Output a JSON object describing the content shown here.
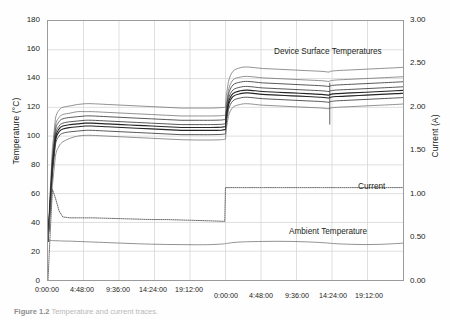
{
  "figure": {
    "caption_label": "Figure 1.2",
    "caption_text": "Temperature and current traces."
  },
  "annotations": {
    "device": "Device Surface Temperatures",
    "current": "Current",
    "ambient": "Ambient Temperature"
  },
  "axes": {
    "left": {
      "title": "Temperature (°C)",
      "ticks": [
        "180",
        "160",
        "140",
        "120",
        "100",
        "80",
        "60",
        "40",
        "20",
        "0"
      ],
      "min": 0,
      "max": 180,
      "step": 20
    },
    "right": {
      "title": "Current (A)",
      "ticks": [
        "3.00",
        "2.50",
        "2.00",
        "1.50",
        "1.00",
        "0.50",
        "0.00"
      ],
      "min": 0,
      "max": 3,
      "step": 0.5
    },
    "bottom": {
      "ticks": [
        "0:00:00",
        "4:48:00",
        "9:36:00",
        "14:24:00",
        "19:12:00",
        "0:00:00",
        "4:48:00",
        "9:36:00",
        "14:24:00",
        "19:12:00"
      ]
    }
  },
  "colors": {
    "frame": "#9b9b9b",
    "grid": "#d7d7d7",
    "trace": "#3b3b3b",
    "trace_light": "#6e6e6e",
    "dotted": "#5a5a5a",
    "background": "#ffffff",
    "text": "#231f20"
  },
  "chart_data": {
    "type": "line",
    "title": "",
    "xlabel": "",
    "ylabel": "Temperature (°C)",
    "y2label": "Current (A)",
    "ylim": [
      0,
      180
    ],
    "y2lim": [
      0,
      3
    ],
    "xlim": [
      0,
      48
    ],
    "grid": true,
    "legend": "annotations-inline",
    "x_tick_hours": [
      0,
      4.8,
      9.6,
      14.4,
      19.2,
      24,
      28.8,
      33.6,
      38.4,
      43.2
    ],
    "x_tick_labels": [
      "0:00:00",
      "4:48:00",
      "9:36:00",
      "14:24:00",
      "19:12:00",
      "0:00:00",
      "4:48:00",
      "9:36:00",
      "14:24:00",
      "19:12:00"
    ],
    "x_hours": [
      0,
      0.3,
      0.6,
      1,
      1.5,
      2,
      3,
      4,
      5,
      6,
      8,
      10,
      12,
      14,
      16,
      18,
      20,
      22,
      23.5,
      23.9,
      24,
      24.1,
      24.4,
      25,
      26,
      27,
      29,
      31,
      33,
      35,
      37,
      38,
      38.2,
      39,
      41,
      43,
      45,
      47,
      48
    ],
    "series": [
      {
        "name": "Device Surface Temperature 1",
        "axis": "left",
        "style": "solid-thin",
        "values": [
          27,
          62,
          92,
          112,
          118,
          120,
          121,
          122,
          122.5,
          122.5,
          122,
          121.5,
          121,
          120.5,
          120,
          119.5,
          119.5,
          119.5,
          119.8,
          120,
          120,
          128,
          138,
          145,
          147.5,
          148,
          147,
          146.5,
          146,
          145.5,
          145,
          144.5,
          145,
          145.5,
          146,
          146.5,
          147,
          147.5,
          147.8
        ]
      },
      {
        "name": "Device Surface Temperature 2",
        "axis": "left",
        "style": "solid-thin",
        "values": [
          27,
          59,
          87,
          107,
          113,
          115,
          116,
          117,
          117,
          117,
          116.5,
          116,
          115.5,
          115,
          114.5,
          114,
          114,
          114,
          114.2,
          114.5,
          114.5,
          122,
          132,
          139,
          141,
          141.5,
          140.5,
          140,
          139.5,
          139,
          138.5,
          138,
          138.5,
          139,
          139.5,
          140,
          140.5,
          141,
          141.3
        ]
      },
      {
        "name": "Device Surface Temperature 3",
        "axis": "left",
        "style": "solid-med",
        "values": [
          27,
          57,
          84,
          104,
          110,
          112,
          113,
          113.5,
          114,
          114,
          113.5,
          113,
          112.5,
          112,
          111.5,
          111,
          111,
          111,
          111.2,
          111.5,
          111.5,
          119,
          129,
          135.5,
          137.5,
          138,
          137,
          136.5,
          136,
          135.5,
          135,
          134.5,
          135,
          135.5,
          136,
          136.5,
          137,
          137.5,
          137.8
        ]
      },
      {
        "name": "Device Surface Temperature 4",
        "axis": "left",
        "style": "solid-med",
        "values": [
          27,
          55,
          81,
          101,
          107,
          109,
          110,
          110.5,
          111,
          111,
          110.5,
          110,
          109.5,
          109,
          108.5,
          108,
          108,
          108,
          108.2,
          108.5,
          108.5,
          116,
          126,
          132,
          134,
          134.5,
          133.5,
          133,
          132.5,
          132,
          131.5,
          131,
          131.5,
          132,
          132.5,
          133,
          133.5,
          134,
          134.3
        ]
      },
      {
        "name": "Device Surface Temperature 5",
        "axis": "left",
        "style": "solid-bold",
        "values": [
          27,
          54,
          79,
          99,
          105,
          107,
          108,
          108.5,
          109,
          109,
          108.5,
          108,
          107.5,
          107,
          106.5,
          106,
          106,
          106,
          106.2,
          106.5,
          106.5,
          114,
          123.5,
          129.5,
          131.5,
          132,
          131,
          130.5,
          130,
          129.5,
          129,
          128.5,
          129,
          129.5,
          130,
          130.5,
          131,
          131.5,
          131.8
        ]
      },
      {
        "name": "Device Surface Temperature 6",
        "axis": "left",
        "style": "solid-bold",
        "values": [
          27,
          52,
          77,
          97,
          103,
          105,
          106,
          106.5,
          107,
          107,
          106.5,
          106,
          105.5,
          105,
          104.5,
          104,
          104,
          104,
          104.2,
          104.5,
          104.5,
          112,
          121.5,
          127.5,
          129.5,
          130,
          129,
          128.5,
          128,
          127.5,
          127,
          126.5,
          127,
          127.5,
          128,
          128.5,
          129,
          129.5,
          129.8
        ]
      },
      {
        "name": "Device Surface Temperature 7",
        "axis": "left",
        "style": "solid-med",
        "values": [
          27,
          50,
          74,
          94,
          100,
          102,
          103,
          103.5,
          104,
          104,
          103.5,
          103,
          102.5,
          102,
          101.5,
          101,
          101,
          101,
          101.2,
          101.5,
          101.5,
          109,
          118.5,
          124.5,
          126.5,
          127,
          126,
          125.5,
          125,
          124.5,
          124,
          123.5,
          124,
          124.5,
          125,
          125.5,
          126,
          126.5,
          126.8
        ]
      },
      {
        "name": "Device Surface Temperature 8",
        "axis": "left",
        "style": "solid-thin",
        "values": [
          27,
          45,
          66,
          86,
          93,
          96,
          98.5,
          100,
          100.5,
          100.5,
          100,
          99.5,
          99,
          98.5,
          98,
          97.5,
          97.3,
          97.3,
          97.5,
          97.8,
          97.8,
          105,
          114,
          120,
          122,
          122.5,
          121.5,
          121,
          120.5,
          120,
          119.5,
          119,
          119.5,
          120,
          120.5,
          121,
          121.5,
          122,
          122.3
        ]
      },
      {
        "name": "Ambient Temperature",
        "axis": "left",
        "style": "solid-thin",
        "values": [
          27.5,
          27.5,
          27.4,
          27.3,
          27.2,
          27.1,
          27,
          26.8,
          26.6,
          26.4,
          26,
          25.6,
          25.2,
          24.9,
          24.7,
          24.6,
          24.5,
          24.6,
          25,
          25.2,
          25.3,
          25.4,
          25.6,
          26,
          26.4,
          26.6,
          26.8,
          26.9,
          26.8,
          26.5,
          26,
          25.6,
          25.5,
          25.2,
          24.8,
          24.6,
          24.8,
          25.3,
          25.6
        ]
      },
      {
        "name": "Current",
        "axis": "right",
        "style": "dotted",
        "values": [
          0.0,
          0.55,
          1.05,
          0.95,
          0.8,
          0.73,
          0.72,
          0.72,
          0.72,
          0.72,
          0.715,
          0.71,
          0.705,
          0.7,
          0.7,
          0.695,
          0.69,
          0.685,
          0.68,
          0.68,
          1.07,
          1.07,
          1.07,
          1.07,
          1.07,
          1.07,
          1.07,
          1.07,
          1.07,
          1.07,
          1.07,
          1.07,
          1.07,
          1.07,
          1.07,
          1.07,
          1.07,
          1.07,
          1.07
        ]
      }
    ]
  }
}
